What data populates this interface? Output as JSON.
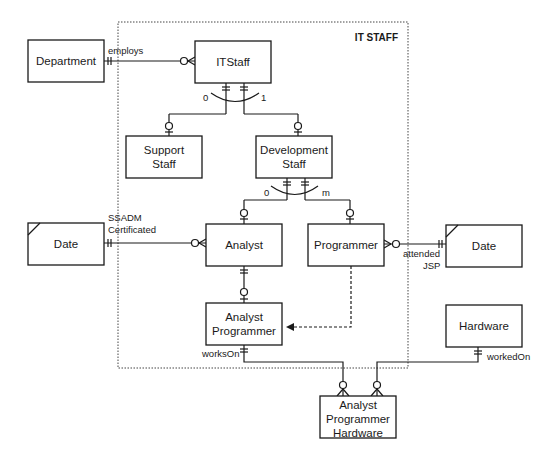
{
  "diagram": {
    "boundary_title": "IT STAFF",
    "entities": {
      "department": {
        "label": [
          "Department"
        ],
        "x": 28,
        "y": 40,
        "w": 76,
        "h": 42,
        "external": false
      },
      "itstaff": {
        "label": [
          "ITStaff"
        ],
        "x": 195,
        "y": 41,
        "w": 76,
        "h": 42,
        "external": false
      },
      "support_staff": {
        "label": [
          "Support",
          "Staff"
        ],
        "x": 126,
        "y": 136,
        "w": 76,
        "h": 42,
        "external": false
      },
      "development_staff": {
        "label": [
          "Development",
          "Staff"
        ],
        "x": 256,
        "y": 136,
        "w": 76,
        "h": 42,
        "external": false
      },
      "analyst": {
        "label": [
          "Analyst"
        ],
        "x": 206,
        "y": 224,
        "w": 76,
        "h": 42,
        "external": false
      },
      "programmer": {
        "label": [
          "Programmer"
        ],
        "x": 308,
        "y": 224,
        "w": 76,
        "h": 42,
        "external": false
      },
      "date_left": {
        "label": [
          "Date"
        ],
        "x": 28,
        "y": 223,
        "w": 76,
        "h": 42,
        "external": true
      },
      "date_right": {
        "label": [
          "Date"
        ],
        "x": 446,
        "y": 225,
        "w": 76,
        "h": 42,
        "external": true
      },
      "analyst_programmer": {
        "label": [
          "Analyst",
          "Programmer"
        ],
        "x": 206,
        "y": 303,
        "w": 76,
        "h": 42,
        "external": false
      },
      "hardware": {
        "label": [
          "Hardware"
        ],
        "x": 446,
        "y": 305,
        "w": 76,
        "h": 42,
        "external": false
      },
      "analyst_programmer_hardware": {
        "label": [
          "Analyst",
          "Programmer",
          "Hardware"
        ],
        "x": 320,
        "y": 396,
        "w": 76,
        "h": 42,
        "external": false
      }
    },
    "relationship_labels": {
      "employs": "employs",
      "ssadm_line1": "SSADM",
      "ssadm_line2": "Certificated",
      "attended_line1": "attended",
      "attended_line2": "JSP",
      "works_on": "worksOn",
      "worked_on": "workedOn",
      "exclusion_top_left": "0",
      "exclusion_top_right": "1",
      "exclusion_dev_left": "0",
      "exclusion_dev_right": "m"
    }
  }
}
